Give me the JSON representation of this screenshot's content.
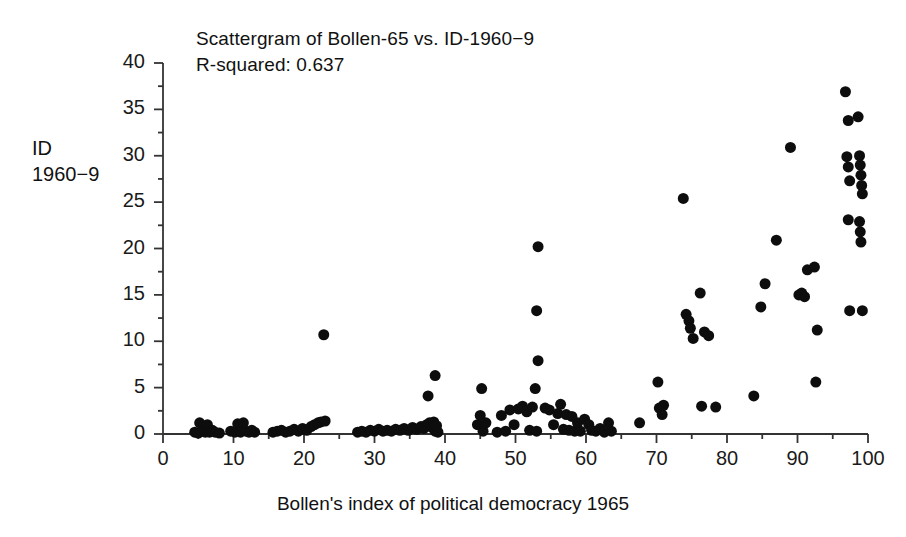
{
  "chart_data": {
    "type": "scatter",
    "title": "Scattergram of Bollen-65 vs. ID-1960−9",
    "subtitle": "R-squared: 0.637",
    "r_squared": 0.637,
    "xlabel": "Bollen's index of political democracy 1965",
    "ylabel_line1": "ID",
    "ylabel_line2": "1960−9",
    "xlim": [
      0,
      100
    ],
    "ylim": [
      0,
      40
    ],
    "xticks": [
      0,
      10,
      20,
      30,
      40,
      50,
      60,
      70,
      80,
      90,
      100
    ],
    "xtick_labels": [
      "0",
      "10",
      "20",
      "30",
      "40",
      "50",
      "60",
      "70",
      "80",
      "90",
      "100"
    ],
    "xminor_step": 5,
    "yticks": [
      0,
      5,
      10,
      15,
      20,
      25,
      30,
      35,
      40
    ],
    "ytick_labels": [
      "0",
      "5",
      "10",
      "15",
      "20",
      "25",
      "30",
      "35",
      "40"
    ],
    "yminor_step": 2.5,
    "grid": false,
    "legend": null,
    "marker": {
      "shape": "circle",
      "color": "#0d0d0d",
      "size_px": 11
    },
    "points": [
      [
        4.5,
        0.2
      ],
      [
        5.0,
        0.1
      ],
      [
        5.2,
        1.2
      ],
      [
        5.6,
        0.3
      ],
      [
        6.0,
        0.2
      ],
      [
        6.3,
        1.0
      ],
      [
        6.6,
        0.2
      ],
      [
        7.0,
        0.4
      ],
      [
        7.4,
        0.2
      ],
      [
        8.0,
        0.1
      ],
      [
        9.6,
        0.3
      ],
      [
        10.2,
        0.2
      ],
      [
        10.6,
        1.1
      ],
      [
        11.0,
        0.2
      ],
      [
        11.4,
        1.2
      ],
      [
        11.8,
        0.3
      ],
      [
        12.2,
        0.2
      ],
      [
        12.6,
        0.4
      ],
      [
        13.0,
        0.2
      ],
      [
        15.6,
        0.2
      ],
      [
        16.2,
        0.3
      ],
      [
        16.8,
        0.4
      ],
      [
        17.4,
        0.2
      ],
      [
        18.0,
        0.3
      ],
      [
        18.6,
        0.5
      ],
      [
        19.2,
        0.3
      ],
      [
        19.8,
        0.6
      ],
      [
        20.4,
        0.4
      ],
      [
        21.0,
        0.8
      ],
      [
        21.5,
        1.0
      ],
      [
        22.0,
        1.2
      ],
      [
        22.4,
        1.3
      ],
      [
        23.0,
        1.4
      ],
      [
        22.8,
        10.7
      ],
      [
        27.6,
        0.2
      ],
      [
        28.2,
        0.3
      ],
      [
        28.8,
        0.2
      ],
      [
        29.4,
        0.4
      ],
      [
        30.0,
        0.3
      ],
      [
        30.6,
        0.5
      ],
      [
        31.2,
        0.3
      ],
      [
        31.8,
        0.4
      ],
      [
        32.4,
        0.3
      ],
      [
        33.0,
        0.5
      ],
      [
        33.6,
        0.4
      ],
      [
        34.2,
        0.6
      ],
      [
        34.8,
        0.4
      ],
      [
        35.4,
        0.7
      ],
      [
        36.0,
        0.5
      ],
      [
        36.6,
        0.8
      ],
      [
        37.0,
        0.6
      ],
      [
        37.4,
        1.0
      ],
      [
        37.8,
        1.2
      ],
      [
        38.2,
        0.7
      ],
      [
        38.4,
        1.3
      ],
      [
        38.6,
        0.3
      ],
      [
        38.8,
        0.9
      ],
      [
        39.0,
        0.2
      ],
      [
        37.6,
        4.1
      ],
      [
        38.6,
        6.3
      ],
      [
        44.6,
        1.0
      ],
      [
        45.0,
        2.0
      ],
      [
        45.4,
        0.3
      ],
      [
        45.8,
        1.2
      ],
      [
        45.2,
        4.9
      ],
      [
        47.4,
        0.2
      ],
      [
        48.0,
        2.0
      ],
      [
        48.6,
        0.3
      ],
      [
        49.2,
        2.6
      ],
      [
        49.8,
        1.0
      ],
      [
        50.4,
        2.7
      ],
      [
        51.0,
        3.0
      ],
      [
        51.6,
        2.4
      ],
      [
        52.0,
        0.4
      ],
      [
        52.4,
        2.9
      ],
      [
        53.0,
        0.3
      ],
      [
        53.2,
        20.2
      ],
      [
        53.0,
        13.3
      ],
      [
        53.2,
        7.9
      ],
      [
        52.8,
        4.9
      ],
      [
        54.2,
        2.8
      ],
      [
        54.8,
        2.6
      ],
      [
        55.4,
        1.0
      ],
      [
        56.0,
        2.2
      ],
      [
        56.4,
        3.2
      ],
      [
        56.8,
        0.5
      ],
      [
        57.2,
        2.1
      ],
      [
        57.6,
        0.4
      ],
      [
        58.0,
        1.9
      ],
      [
        58.4,
        0.3
      ],
      [
        58.8,
        1.2
      ],
      [
        59.2,
        0.3
      ],
      [
        59.8,
        1.6
      ],
      [
        60.4,
        1.0
      ],
      [
        60.8,
        0.4
      ],
      [
        61.4,
        0.3
      ],
      [
        62.0,
        0.6
      ],
      [
        62.6,
        0.2
      ],
      [
        63.2,
        1.2
      ],
      [
        63.6,
        0.3
      ],
      [
        67.6,
        1.2
      ],
      [
        70.4,
        2.8
      ],
      [
        70.8,
        2.1
      ],
      [
        71.0,
        3.1
      ],
      [
        70.2,
        5.6
      ],
      [
        73.8,
        25.4
      ],
      [
        74.2,
        12.9
      ],
      [
        74.6,
        12.2
      ],
      [
        74.8,
        11.4
      ],
      [
        75.2,
        10.3
      ],
      [
        76.2,
        15.2
      ],
      [
        76.8,
        11.0
      ],
      [
        77.4,
        10.6
      ],
      [
        76.4,
        3.0
      ],
      [
        78.4,
        2.9
      ],
      [
        83.8,
        4.1
      ],
      [
        84.8,
        13.7
      ],
      [
        85.4,
        16.2
      ],
      [
        87.0,
        20.9
      ],
      [
        89.0,
        30.9
      ],
      [
        90.2,
        15.0
      ],
      [
        90.6,
        15.2
      ],
      [
        91.0,
        14.8
      ],
      [
        91.4,
        17.7
      ],
      [
        92.4,
        18.0
      ],
      [
        92.8,
        11.2
      ],
      [
        92.6,
        5.6
      ],
      [
        96.8,
        36.9
      ],
      [
        97.2,
        33.8
      ],
      [
        98.6,
        34.2
      ],
      [
        97.0,
        29.9
      ],
      [
        97.2,
        28.8
      ],
      [
        97.4,
        27.3
      ],
      [
        98.8,
        30.0
      ],
      [
        98.9,
        29.0
      ],
      [
        99.0,
        27.9
      ],
      [
        99.1,
        26.8
      ],
      [
        99.2,
        25.9
      ],
      [
        97.2,
        23.1
      ],
      [
        98.8,
        22.9
      ],
      [
        98.9,
        21.8
      ],
      [
        99.0,
        20.7
      ],
      [
        97.4,
        13.3
      ],
      [
        99.2,
        13.3
      ]
    ],
    "point_count": 138
  }
}
